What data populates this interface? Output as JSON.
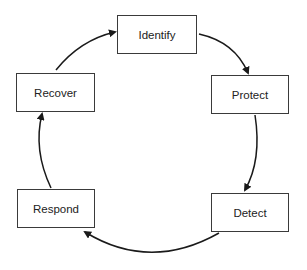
{
  "diagram": {
    "type": "cycle",
    "nodes": [
      {
        "id": "identify",
        "label": "Identify"
      },
      {
        "id": "protect",
        "label": "Protect"
      },
      {
        "id": "detect",
        "label": "Detect"
      },
      {
        "id": "respond",
        "label": "Respond"
      },
      {
        "id": "recover",
        "label": "Recover"
      }
    ],
    "edges": [
      {
        "from": "identify",
        "to": "protect"
      },
      {
        "from": "protect",
        "to": "detect"
      },
      {
        "from": "detect",
        "to": "respond"
      },
      {
        "from": "respond",
        "to": "recover"
      },
      {
        "from": "recover",
        "to": "identify"
      }
    ],
    "colors": {
      "stroke": "#1a1a1a",
      "box_border": "#3a3a3a",
      "background": "#ffffff"
    }
  }
}
